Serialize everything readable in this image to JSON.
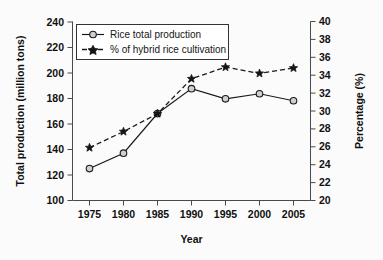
{
  "chart_data": {
    "type": "line",
    "title": "",
    "xlabel": "Year",
    "ylabel": "Total production (million tons)",
    "y2label": "Percentage (%)",
    "x": [
      1975,
      1980,
      1985,
      1990,
      1995,
      2000,
      2005
    ],
    "xticklabels": [
      "1975",
      "1980",
      "1985",
      "1990",
      "1995",
      "2000",
      "2005"
    ],
    "xlim": [
      1972.5,
      2007.5
    ],
    "ylim": [
      100,
      240
    ],
    "yticks": [
      100,
      120,
      140,
      160,
      180,
      200,
      220,
      240
    ],
    "yticklabels": [
      "100",
      "120",
      "140",
      "160",
      "180",
      "200",
      "220",
      "240"
    ],
    "y2lim": [
      20,
      40
    ],
    "y2ticks": [
      20,
      22,
      24,
      26,
      28,
      30,
      32,
      34,
      36,
      38,
      40
    ],
    "y2ticklabels": [
      "20",
      "22",
      "24",
      "26",
      "28",
      "30",
      "32",
      "34",
      "36",
      "38",
      "40"
    ],
    "grid": false,
    "legend_position": "upper left",
    "series": [
      {
        "name": "Rice total production",
        "axis": "left",
        "linestyle": "solid",
        "marker": "open-circle",
        "color": "#1a1a1a",
        "values": [
          125,
          137,
          168,
          187.5,
          179.5,
          183.5,
          178
        ]
      },
      {
        "name": "% of hybrid rice cultivation",
        "axis": "right",
        "linestyle": "dashed",
        "marker": "filled-star",
        "color": "#141414",
        "values": [
          25.9,
          27.7,
          29.7,
          33.6,
          34.9,
          34.2,
          34.8
        ]
      }
    ]
  },
  "legend": {
    "entries": [
      {
        "label": "Rice total production"
      },
      {
        "label": "% of hybrid rice cultivation"
      }
    ]
  },
  "colors": {
    "background": "#fbfbfb",
    "axis": "#4a4a4a",
    "ink": "#141414",
    "marker_fill": "#cfcfcf"
  }
}
